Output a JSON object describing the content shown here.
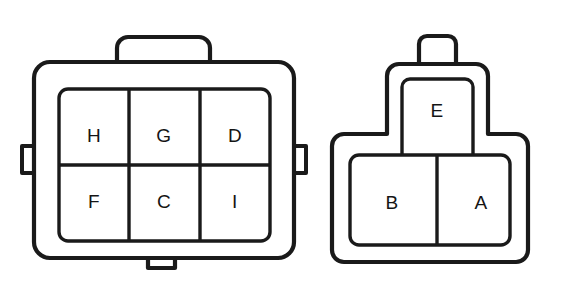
{
  "diagram": {
    "background_color": "#ffffff",
    "line_color": "#1a1a1a",
    "label_color": "#141414",
    "connectors": [
      {
        "id": "left-connector",
        "name": "six-way-connector",
        "cavity_count": 6,
        "shape": "rounded-rectangle-shell",
        "features": [
          "top-latch-tab",
          "left-side-notch",
          "right-side-notch",
          "bottom-tab"
        ],
        "rows": [
          {
            "row": "top",
            "cells": [
              {
                "label": "H",
                "position": "top-left"
              },
              {
                "label": "G",
                "position": "top-center"
              },
              {
                "label": "D",
                "position": "top-right"
              }
            ]
          },
          {
            "row": "bottom",
            "cells": [
              {
                "label": "F",
                "position": "bottom-left"
              },
              {
                "label": "C",
                "position": "bottom-center"
              },
              {
                "label": "I",
                "position": "bottom-right"
              }
            ]
          }
        ]
      },
      {
        "id": "right-connector",
        "name": "three-way-connector",
        "cavity_count": 3,
        "shape": "tee-shaped-shell",
        "features": [
          "top-latch-tab"
        ],
        "rows": [
          {
            "row": "upper",
            "cells": [
              {
                "label": "E",
                "position": "top-center"
              }
            ]
          },
          {
            "row": "lower",
            "cells": [
              {
                "label": "B",
                "position": "bottom-left"
              },
              {
                "label": "A",
                "position": "bottom-right"
              }
            ]
          }
        ]
      }
    ]
  }
}
